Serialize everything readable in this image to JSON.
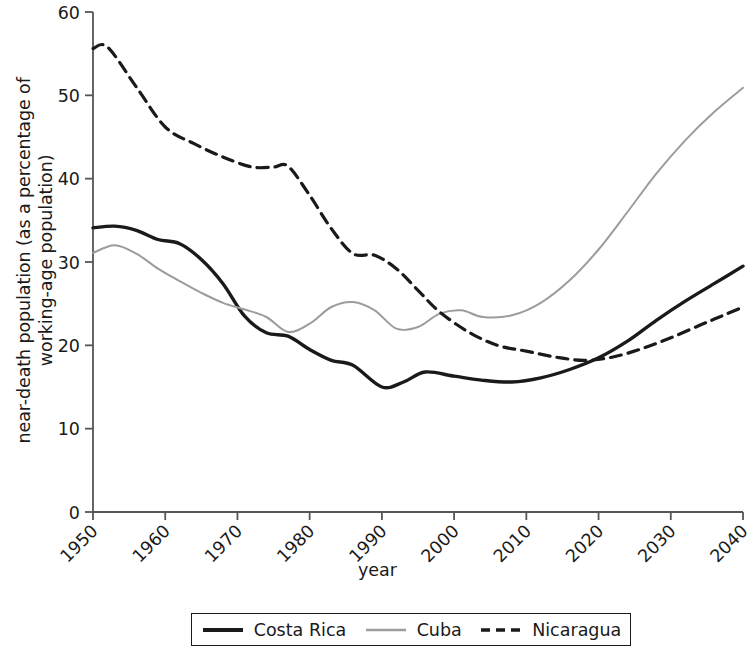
{
  "chart_data": {
    "type": "line",
    "title": "",
    "xlabel": "year",
    "ylabel": "near-death population (as a percentage of working-age population)",
    "ylabel_line1": "near-death population (as a percentage of",
    "ylabel_line2": "working-age population)",
    "xlim": [
      1950,
      2040
    ],
    "ylim": [
      0,
      60
    ],
    "xticks": [
      1950,
      1960,
      1970,
      1980,
      1990,
      2000,
      2010,
      2020,
      2030,
      2040
    ],
    "xticklabels": [
      "1950",
      "1960",
      "1970",
      "1980",
      "1990",
      "2000",
      "2010",
      "2020",
      "2030",
      "2040"
    ],
    "yticks": [
      0,
      10,
      20,
      30,
      40,
      50,
      60
    ],
    "yticklabels": [
      "0",
      "10",
      "20",
      "30",
      "40",
      "50",
      "60"
    ],
    "grid": false,
    "legend_position": "below-center",
    "xtick_label_rotation": -45,
    "series": [
      {
        "name": "Costa Rica",
        "color": "#1a1a1a",
        "style": "solid",
        "width": 3.4,
        "x": [
          1950,
          1953,
          1956,
          1959,
          1962,
          1965,
          1968,
          1971,
          1974,
          1977,
          1980,
          1983,
          1986,
          1990,
          1993,
          1996,
          2000,
          2004,
          2008,
          2012,
          2016,
          2020,
          2024,
          2028,
          2032,
          2036,
          2040
        ],
        "values": [
          34.1,
          34.3,
          33.8,
          32.7,
          32.2,
          30.3,
          27.4,
          23.5,
          21.5,
          21.1,
          19.5,
          18.2,
          17.6,
          15.0,
          15.6,
          16.8,
          16.3,
          15.8,
          15.6,
          16.1,
          17.1,
          18.5,
          20.5,
          23.0,
          25.3,
          27.4,
          29.5
        ]
      },
      {
        "name": "Cuba",
        "color": "#9c9c9c",
        "style": "solid",
        "width": 2.0,
        "x": [
          1950,
          1953,
          1956,
          1959,
          1962,
          1965,
          1968,
          1971,
          1974,
          1977,
          1980,
          1983,
          1986,
          1989,
          1992,
          1995,
          1998,
          2001,
          2004,
          2008,
          2012,
          2016,
          2020,
          2024,
          2028,
          2032,
          2036,
          2040
        ],
        "values": [
          31.1,
          32.0,
          31.0,
          29.2,
          27.7,
          26.3,
          25.1,
          24.3,
          23.4,
          21.6,
          22.6,
          24.6,
          25.2,
          24.2,
          22.0,
          22.2,
          23.8,
          24.2,
          23.4,
          23.6,
          25.1,
          27.8,
          31.5,
          36.0,
          40.6,
          44.6,
          48.0,
          50.9
        ]
      },
      {
        "name": "Nicaragua",
        "color": "#1a1a1a",
        "style": "dashed",
        "width": 3.2,
        "x": [
          1950,
          1952,
          1956,
          1960,
          1964,
          1968,
          1972,
          1975,
          1977,
          1980,
          1983,
          1986,
          1989,
          1992,
          1995,
          1998,
          2002,
          2006,
          2010,
          2014,
          2018,
          2022,
          2026,
          2030,
          2034,
          2037,
          2040
        ],
        "values": [
          55.6,
          55.8,
          51.0,
          46.2,
          44.2,
          42.6,
          41.4,
          41.4,
          41.5,
          38.0,
          34.0,
          31.0,
          30.8,
          29.2,
          26.6,
          24.0,
          21.6,
          20.0,
          19.3,
          18.6,
          18.2,
          18.6,
          19.6,
          20.9,
          22.4,
          23.5,
          24.6
        ]
      }
    ]
  },
  "legend": {
    "entries": [
      {
        "label": "Costa Rica",
        "style": "solid-thick",
        "color": "#1a1a1a"
      },
      {
        "label": "Cuba",
        "style": "solid-thin",
        "color": "#9c9c9c"
      },
      {
        "label": "Nicaragua",
        "style": "dashed",
        "color": "#1a1a1a"
      }
    ]
  },
  "axes": {
    "spine_color": "#555555",
    "tick_color": "#555555"
  }
}
